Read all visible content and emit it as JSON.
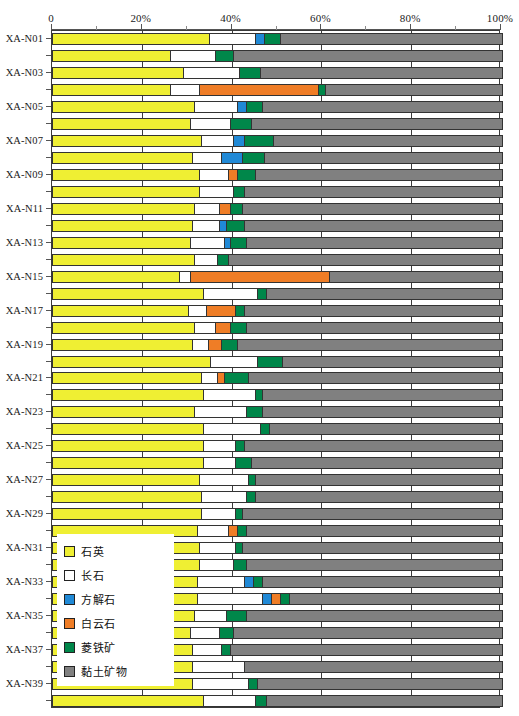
{
  "chart_data": {
    "type": "bar",
    "orientation": "horizontal",
    "stacked": true,
    "title": "",
    "xlabel": "",
    "ylabel": "",
    "xlim": [
      0,
      100
    ],
    "grid": true,
    "legend_position": "inside-left-lower",
    "xtick_labels": [
      "0",
      "20%",
      "40%",
      "60%",
      "80%",
      "100%"
    ],
    "xtick_values": [
      0,
      20,
      40,
      60,
      80,
      100
    ],
    "categories": [
      "XA-N01",
      "XA-N02",
      "XA-N03",
      "XA-N04",
      "XA-N05",
      "XA-N06",
      "XA-N07",
      "XA-N08",
      "XA-N09",
      "XA-N10",
      "XA-N11",
      "XA-N12",
      "XA-N13",
      "XA-N14",
      "XA-N15",
      "XA-N16",
      "XA-N17",
      "XA-N18",
      "XA-N19",
      "XA-N20",
      "XA-N21",
      "XA-N22",
      "XA-N23",
      "XA-N24",
      "XA-N25",
      "XA-N26",
      "XA-N27",
      "XA-N28",
      "XA-N29",
      "XA-N30",
      "XA-N31",
      "XA-N32",
      "XA-N33",
      "XA-N34",
      "XA-N35",
      "XA-N36",
      "XA-N37",
      "XA-N38",
      "XA-N39",
      "XA-N40"
    ],
    "visible_category_labels": [
      "XA-N01",
      "XA-N03",
      "XA-N05",
      "XA-N07",
      "XA-N09",
      "XA-N11",
      "XA-N13",
      "XA-N15",
      "XA-N17",
      "XA-N19",
      "XA-N21",
      "XA-N23",
      "XA-N25",
      "XA-N27",
      "XA-N29",
      "XA-N31",
      "XA-N33",
      "XA-N35",
      "XA-N37",
      "XA-N39"
    ],
    "series": [
      {
        "name": "石英",
        "color": "#efef33",
        "values": [
          34.7,
          26.0,
          29.0,
          26.0,
          31.5,
          30.5,
          33.0,
          31.0,
          32.5,
          32.5,
          31.5,
          31.0,
          30.5,
          31.5,
          28.0,
          33.5,
          30.0,
          31.5,
          31.0,
          35.0,
          33.0,
          33.5,
          31.5,
          33.5,
          33.5,
          33.5,
          32.5,
          33.0,
          33.0,
          32.0,
          32.5,
          32.5,
          32.0,
          32.0,
          31.5,
          30.5,
          31.0,
          31.0,
          31.0,
          33.5
        ]
      },
      {
        "name": "长石",
        "color": "#ffffff",
        "values": [
          10.3,
          10.0,
          12.5,
          6.5,
          9.5,
          9.0,
          7.0,
          6.5,
          6.5,
          7.5,
          5.5,
          6.0,
          7.5,
          5.0,
          2.5,
          12.0,
          4.0,
          4.5,
          3.5,
          10.5,
          3.5,
          11.5,
          11.5,
          12.5,
          7.0,
          7.0,
          11.0,
          10.0,
          7.5,
          7.0,
          8.0,
          7.5,
          10.5,
          14.5,
          7.0,
          6.5,
          6.5,
          11.5,
          12.5,
          11.5
        ]
      },
      {
        "name": "方解石",
        "color": "#2089d6",
        "values": [
          2.0,
          0.0,
          0.0,
          0.0,
          2.0,
          0.0,
          2.5,
          4.5,
          0.0,
          0.0,
          0.0,
          1.5,
          1.5,
          0.0,
          0.0,
          0.0,
          0.0,
          0.0,
          0.0,
          0.0,
          0.0,
          0.0,
          0.0,
          0.0,
          0.0,
          0.0,
          0.0,
          0.0,
          0.0,
          0.0,
          0.0,
          0.0,
          2.0,
          2.0,
          0.0,
          0.0,
          0.0,
          0.0,
          0.0,
          0.0
        ]
      },
      {
        "name": "白云石",
        "color": "#ef7d26",
        "values": [
          0.0,
          0.0,
          0.0,
          26.5,
          0.0,
          0.0,
          0.0,
          0.0,
          2.0,
          0.0,
          2.5,
          0.0,
          0.0,
          0.0,
          31.0,
          0.0,
          6.5,
          3.5,
          3.0,
          0.0,
          1.5,
          0.0,
          0.0,
          0.0,
          0.0,
          0.0,
          0.0,
          0.0,
          0.0,
          2.0,
          0.0,
          0.0,
          0.0,
          2.0,
          0.0,
          0.0,
          0.0,
          0.0,
          0.0,
          0.0
        ]
      },
      {
        "name": "菱铁矿",
        "color": "#00874a",
        "values": [
          3.5,
          4.0,
          4.5,
          1.5,
          3.5,
          4.5,
          6.5,
          5.0,
          4.0,
          2.5,
          2.5,
          4.0,
          3.5,
          2.5,
          0.0,
          2.0,
          2.0,
          3.5,
          3.5,
          5.5,
          5.5,
          1.5,
          3.5,
          2.0,
          2.0,
          3.5,
          1.5,
          2.0,
          1.5,
          2.0,
          1.5,
          3.0,
          2.0,
          2.0,
          4.5,
          3.0,
          2.0,
          0.0,
          2.0,
          2.5
        ]
      },
      {
        "name": "黏土矿物",
        "color": "#808080",
        "values": [
          49.5,
          60.0,
          54.0,
          39.5,
          53.5,
          56.0,
          51.0,
          53.0,
          55.0,
          57.5,
          58.0,
          57.5,
          57.0,
          61.0,
          38.5,
          52.5,
          57.5,
          57.0,
          59.0,
          49.0,
          56.5,
          53.5,
          53.5,
          52.0,
          57.5,
          56.0,
          55.0,
          55.0,
          58.0,
          57.0,
          58.0,
          57.0,
          53.5,
          47.5,
          57.0,
          60.0,
          60.5,
          57.5,
          54.5,
          52.5
        ]
      }
    ]
  },
  "legend": {
    "items": [
      {
        "label": "石英",
        "color": "#efef33"
      },
      {
        "label": "长石",
        "color": "#ffffff"
      },
      {
        "label": "方解石",
        "color": "#2089d6"
      },
      {
        "label": "白云石",
        "color": "#ef7d26"
      },
      {
        "label": "菱铁矿",
        "color": "#00874a"
      },
      {
        "label": "黏土矿物",
        "color": "#808080"
      }
    ]
  }
}
